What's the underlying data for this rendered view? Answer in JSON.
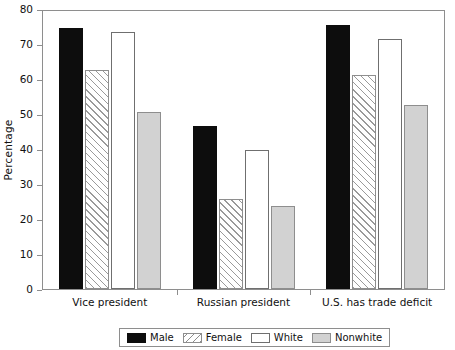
{
  "chart_data": {
    "type": "bar",
    "title": "",
    "xlabel": "",
    "ylabel": "Percentage",
    "ylim": [
      0,
      80
    ],
    "yticks": [
      0,
      10,
      20,
      30,
      40,
      50,
      60,
      70,
      80
    ],
    "ytick_labels": [
      "0",
      "10",
      "20",
      "30",
      "40",
      "50",
      "60",
      "70",
      "80"
    ],
    "grid": false,
    "legend_position": "bottom-center",
    "categories": [
      "Vice president",
      "Russian president",
      "U.S. has trade deficit"
    ],
    "series": [
      {
        "name": "Male",
        "color": "#0d0d0d",
        "pattern": "solid",
        "values": [
          75,
          47,
          76
        ]
      },
      {
        "name": "Female",
        "color": "#ffffff",
        "pattern": "hatch",
        "values": [
          63,
          26,
          61.5
        ]
      },
      {
        "name": "White",
        "color": "#ffffff",
        "pattern": "empty",
        "values": [
          74,
          40,
          72
        ]
      },
      {
        "name": "Nonwhite",
        "color": "#d2d2d2",
        "pattern": "filled",
        "values": [
          51,
          24,
          53
        ]
      }
    ]
  },
  "legend": {
    "items": [
      {
        "label": "Male"
      },
      {
        "label": "Female"
      },
      {
        "label": "White"
      },
      {
        "label": "Nonwhite"
      }
    ]
  }
}
